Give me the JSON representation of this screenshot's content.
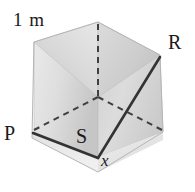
{
  "figure": {
    "name": "cube-diagonal-diagram",
    "background_color": "#ffffff",
    "labels": {
      "edge_length": "1 m",
      "vertex_r": "R",
      "vertex_p": "P",
      "vertex_s": "S",
      "angle_x": "x"
    },
    "colors": {
      "face_left": "#cfcfcf",
      "face_left_light": "#e4e4e4",
      "face_right": "#dcdcdc",
      "face_right_dark": "#c4c4c4",
      "face_top_left": "#d6d6d6",
      "face_top_right": "#cacaca",
      "face_bottom_front": "#e8e8e8",
      "solid_line": "#3a3a3a",
      "dashed_line": "#4a4a4a",
      "outline": "#b8b8b8",
      "text": "#1a1a1a"
    },
    "geometry": {
      "vertex_top": [
        98,
        22
      ],
      "vertex_top_left": [
        34,
        42
      ],
      "vertex_top_right": [
        160,
        55
      ],
      "vertex_left_p": [
        32,
        132
      ],
      "vertex_right": [
        163,
        132
      ],
      "vertex_front_bottom": [
        98,
        157
      ],
      "vertex_hidden_center": [
        98,
        97
      ],
      "edge_length_m": 1
    },
    "solid_path": [
      "P",
      "S-corner",
      "R"
    ],
    "hidden_edges_count": 3
  }
}
